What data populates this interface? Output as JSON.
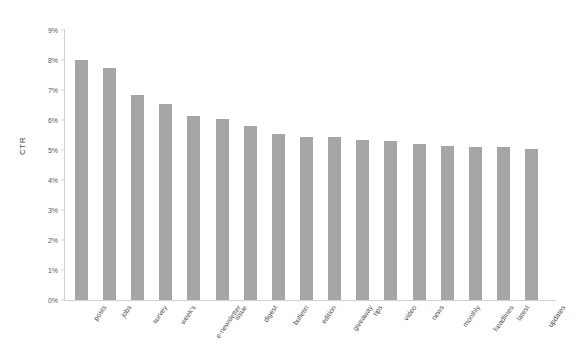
{
  "chart_data": {
    "type": "bar",
    "title": "",
    "xlabel": "",
    "ylabel": "CTR",
    "ylim": [
      0,
      9
    ],
    "ytick_labels": [
      "9%",
      "8%",
      "7%",
      "6%",
      "5%",
      "4%",
      "3%",
      "2%",
      "1%",
      "0%"
    ],
    "ytick_values": [
      9,
      8,
      7,
      6,
      5,
      4,
      3,
      2,
      1,
      0
    ],
    "grid": false,
    "legend": "none",
    "bar_color": "#a6a6a6",
    "categories": [
      "posts",
      "jobs",
      "survey",
      "week's",
      "e-newsletter",
      "issue",
      "digest",
      "bulletin",
      "edition",
      "giveaway",
      "tips",
      "video",
      "news",
      "monthly",
      "headlines",
      "latest",
      "updates"
    ],
    "values": [
      8.0,
      7.75,
      6.85,
      6.55,
      6.15,
      6.05,
      5.8,
      5.55,
      5.45,
      5.45,
      5.35,
      5.3,
      5.2,
      5.15,
      5.1,
      5.1,
      5.05
    ],
    "value_unit": "%"
  }
}
